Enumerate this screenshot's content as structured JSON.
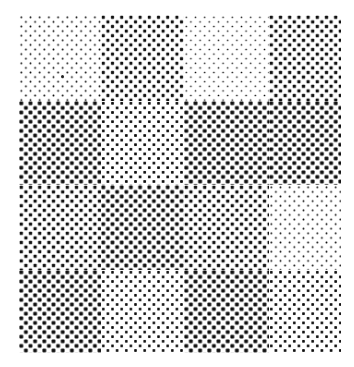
{
  "image": {
    "description": "4x4 grid of halftone-dotted squares at varying gray tone levels",
    "rows": 4,
    "cols": 4,
    "background_color": "#ffffff",
    "dot_color": "#111111",
    "halftone_pitch_px": 4.6,
    "tones": [
      [
        0.15,
        0.5,
        0.12,
        0.55
      ],
      [
        0.75,
        0.4,
        0.8,
        0.78
      ],
      [
        0.55,
        0.72,
        0.55,
        0.15
      ],
      [
        0.75,
        0.35,
        0.78,
        0.38
      ]
    ],
    "speck": {
      "x": 62,
      "y": 76
    }
  }
}
